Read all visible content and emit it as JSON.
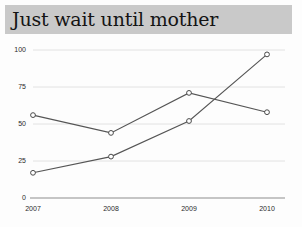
{
  "title": {
    "text": "Just wait until mother",
    "banner_color": "#c9c9c9",
    "text_color": "#141414"
  },
  "page": {
    "background": "#fdfdfd"
  },
  "chart_data": {
    "type": "line",
    "title": "Just wait until mother",
    "xlabel": "",
    "ylabel": "",
    "categories": [
      "2007",
      "2008",
      "2009",
      "2010"
    ],
    "ylim": [
      0,
      100
    ],
    "yticks": [
      0,
      25,
      50,
      75,
      100
    ],
    "ytick_labels": [
      "0",
      "25",
      "50",
      "75",
      "100"
    ],
    "grid": true,
    "grid_color": "#e2e2e2",
    "legend": "none",
    "line_color": "#555555",
    "marker": "open-circle",
    "series": [
      {
        "name": "series-1",
        "values": [
          56,
          44,
          71,
          58
        ]
      },
      {
        "name": "series-2",
        "values": [
          17,
          28,
          52,
          97
        ]
      }
    ]
  },
  "axis": {
    "y": {
      "t0": "0",
      "t1": "25",
      "t2": "50",
      "t3": "75",
      "t4": "100"
    },
    "x": {
      "t0": "2007",
      "t1": "2008",
      "t2": "2009",
      "t3": "2010"
    }
  }
}
